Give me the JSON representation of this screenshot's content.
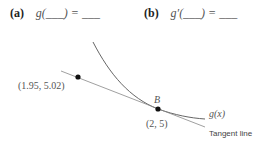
{
  "questions": [
    {
      "label": "(a)",
      "expression": "g(___) = ___"
    },
    {
      "label": "(b)",
      "expression": "g′(___) = ___"
    }
  ],
  "diagram": {
    "curve_label": "g(x)",
    "tangent_label": "Tangent line",
    "point_b": {
      "name": "B",
      "coords": "(2, 5)"
    },
    "point_left": {
      "coords": "(1.95, 5.02)"
    },
    "colors": {
      "curve": "#666666",
      "tangent": "#888888",
      "point": "#111111"
    }
  }
}
